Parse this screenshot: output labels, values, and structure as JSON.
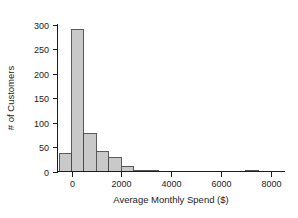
{
  "chart_data": {
    "type": "bar",
    "title": "",
    "xlabel": "Average Monthly Spend ($)",
    "ylabel": "# of Customers",
    "xlim": [
      -500,
      8300
    ],
    "ylim": [
      0,
      310
    ],
    "grid": false,
    "legend": null,
    "bin_width": 500,
    "bar_color": "#c9c9c9",
    "bar_edge_color": "#4a4a4a",
    "axis_color": "#1c1c1c",
    "xticks": [
      0,
      2000,
      4000,
      6000,
      8000
    ],
    "xtick_labels": [
      "0",
      "2000",
      "4000",
      "6000",
      "8000"
    ],
    "yticks": [
      0,
      50,
      100,
      150,
      200,
      250,
      300
    ],
    "ytick_labels": [
      "0",
      "50",
      "100",
      "150",
      "200",
      "250",
      "300"
    ],
    "bins": [
      {
        "x0": -500,
        "x1": 0,
        "value": 36
      },
      {
        "x0": 0,
        "x1": 500,
        "value": 290
      },
      {
        "x0": 500,
        "x1": 1000,
        "value": 77
      },
      {
        "x0": 1000,
        "x1": 1500,
        "value": 40
      },
      {
        "x0": 1500,
        "x1": 2000,
        "value": 28
      },
      {
        "x0": 2000,
        "x1": 2500,
        "value": 11
      },
      {
        "x0": 2500,
        "x1": 3000,
        "value": 3
      },
      {
        "x0": 3000,
        "x1": 3500,
        "value": 3
      },
      {
        "x0": 3500,
        "x1": 4000,
        "value": 0
      },
      {
        "x0": 4000,
        "x1": 4500,
        "value": 0
      },
      {
        "x0": 4500,
        "x1": 5000,
        "value": 0
      },
      {
        "x0": 5000,
        "x1": 5500,
        "value": 0
      },
      {
        "x0": 5500,
        "x1": 6000,
        "value": 0
      },
      {
        "x0": 6000,
        "x1": 6500,
        "value": 0
      },
      {
        "x0": 6500,
        "x1": 7000,
        "value": 0
      },
      {
        "x0": 7000,
        "x1": 7500,
        "value": 3
      },
      {
        "x0": 7500,
        "x1": 8000,
        "value": 0
      }
    ]
  }
}
